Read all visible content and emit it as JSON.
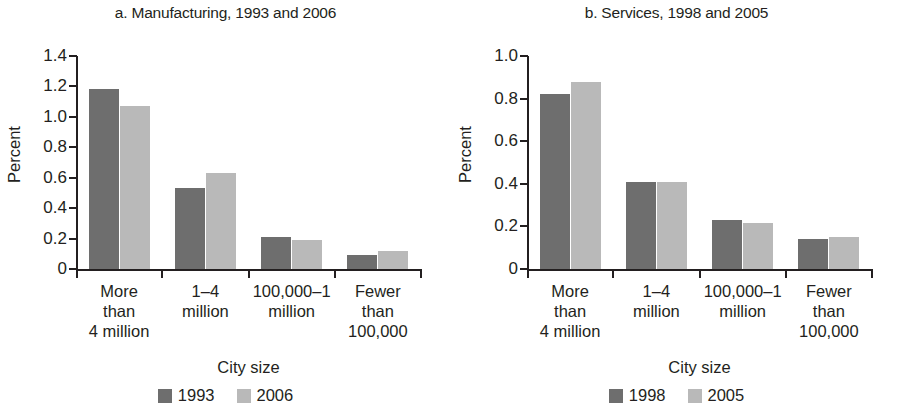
{
  "colors": {
    "series1": "#6e6e6e",
    "series2": "#b9b9b9",
    "axis": "#231f20",
    "background": "#ffffff"
  },
  "figure": {
    "panel_count": 2
  },
  "chart_data": [
    {
      "type": "bar",
      "panel": "a",
      "title": "a. Manufacturing, 1993 and 2006",
      "xlabel": "City size",
      "ylabel": "Percent",
      "ylim": [
        0,
        1.4
      ],
      "yticks": [
        "0",
        "0.2",
        "0.4",
        "0.6",
        "0.8",
        "1.0",
        "1.2",
        "1.4"
      ],
      "ytick_values": [
        0,
        0.2,
        0.4,
        0.6,
        0.8,
        1.0,
        1.2,
        1.4
      ],
      "grid": false,
      "legend_position": "bottom",
      "categories": [
        "More\nthan\n4 million",
        "1–4\nmillion",
        "100,000–1\nmillion",
        "Fewer\nthan\n100,000"
      ],
      "series": [
        {
          "name": "1993",
          "values": [
            1.18,
            0.53,
            0.21,
            0.09
          ]
        },
        {
          "name": "2006",
          "values": [
            1.07,
            0.63,
            0.19,
            0.12
          ]
        }
      ]
    },
    {
      "type": "bar",
      "panel": "b",
      "title": "b. Services, 1998 and 2005",
      "xlabel": "City size",
      "ylabel": "Percent",
      "ylim": [
        0,
        1.0
      ],
      "yticks": [
        "0",
        "0.2",
        "0.4",
        "0.6",
        "0.8",
        "1.0"
      ],
      "ytick_values": [
        0,
        0.2,
        0.4,
        0.6,
        0.8,
        1.0
      ],
      "grid": false,
      "legend_position": "bottom",
      "categories": [
        "More\nthan\n4 million",
        "1–4\nmillion",
        "100,000–1\nmillion",
        "Fewer\nthan\n100,000"
      ],
      "series": [
        {
          "name": "1998",
          "values": [
            0.82,
            0.41,
            0.23,
            0.14
          ]
        },
        {
          "name": "2005",
          "values": [
            0.88,
            0.41,
            0.215,
            0.15
          ]
        }
      ]
    }
  ]
}
